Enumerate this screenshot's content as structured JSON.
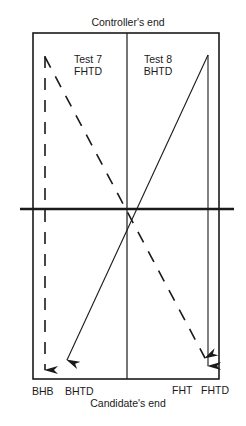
{
  "diagram": {
    "top_label": "Controller's end",
    "bottom_label": "Candidate's end",
    "left_panel": {
      "test": "Test 7",
      "code": "FHTD"
    },
    "right_panel": {
      "test": "Test 8",
      "code": "BHTD"
    },
    "endpoints": [
      "BHB",
      "BHTD",
      "FHT",
      "FHTD"
    ],
    "colors": {
      "line": "#1a1a1a",
      "background": "#ffffff"
    }
  }
}
